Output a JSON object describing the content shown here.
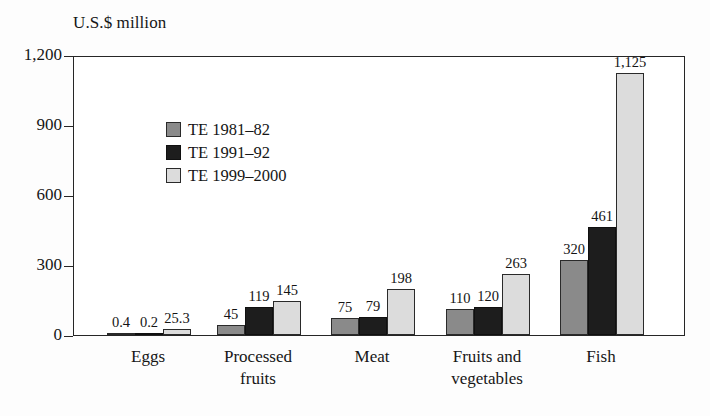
{
  "chart_data": {
    "type": "bar",
    "title": "U.S.$ million",
    "xlabel": "",
    "ylabel": "U.S.$ million",
    "ylim": [
      0,
      1200
    ],
    "yticks": [
      0,
      300,
      600,
      900,
      1200
    ],
    "ytick_labels": [
      "0",
      "300",
      "600",
      "900",
      "1,200"
    ],
    "grid": false,
    "legend_position": "top-left-inside",
    "categories": [
      "Eggs",
      "Processed fruits",
      "Meat",
      "Fruits and vegetables",
      "Fish"
    ],
    "category_lines": [
      [
        "Eggs"
      ],
      [
        "Processed",
        "fruits"
      ],
      [
        "Meat"
      ],
      [
        "Fruits and",
        "vegetables"
      ],
      [
        "Fish"
      ]
    ],
    "series": [
      {
        "name": "TE 1981–82",
        "color": "#8a8a8a",
        "values": [
          0.4,
          45,
          75,
          110,
          320
        ],
        "labels": [
          "0.4",
          "45",
          "75",
          "110",
          "320"
        ]
      },
      {
        "name": "TE 1991–92",
        "color": "#1d1d1d",
        "values": [
          0.2,
          119,
          79,
          120,
          461
        ],
        "labels": [
          "0.2",
          "119",
          "79",
          "120",
          "461"
        ]
      },
      {
        "name": "TE 1999–2000",
        "color": "#dcdcdc",
        "values": [
          25.3,
          145,
          198,
          263,
          1125
        ],
        "labels": [
          "25.3",
          "145",
          "198",
          "263",
          "1,125"
        ]
      }
    ]
  },
  "axis": {
    "title": "U.S.$ million"
  },
  "colors": {
    "series_1": "#8a8a8a",
    "series_2": "#1d1d1d",
    "series_3": "#dcdcdc",
    "axis_line": "#262626",
    "text": "#161616",
    "background": "#fdfdfd"
  }
}
